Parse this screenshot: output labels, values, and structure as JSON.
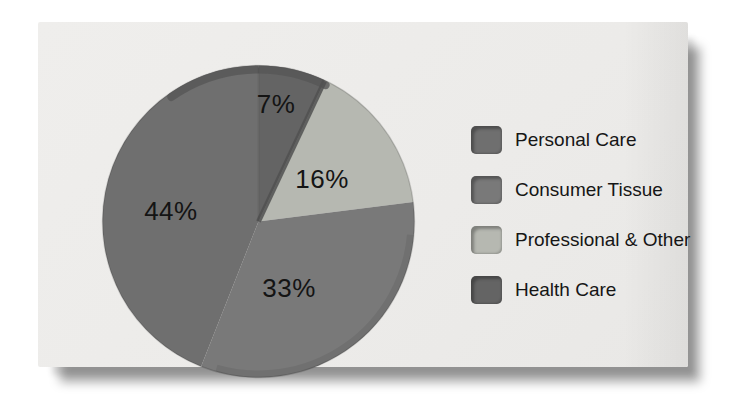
{
  "page": {
    "background": "#ffffff"
  },
  "panel": {
    "background": "#edecea",
    "shadow_color": "rgba(0,0,0,0.35)"
  },
  "chart_data": {
    "type": "pie",
    "title": "",
    "units": "percent",
    "start_angle_deg": 0,
    "direction": "clockwise",
    "legend_position": "right",
    "slices": [
      {
        "label": "Health Care",
        "pct": 7,
        "display": "7%",
        "color": "#646464",
        "label_pos": [
          0.556,
          0.127
        ]
      },
      {
        "label": "Professional & Other",
        "pct": 16,
        "display": "16%",
        "color": "#b6b8b1",
        "label_pos": [
          0.702,
          0.365
        ]
      },
      {
        "label": "Consumer Tissue",
        "pct": 33,
        "display": "33%",
        "color": "#797979",
        "label_pos": [
          0.597,
          0.711
        ]
      },
      {
        "label": "Personal Care",
        "pct": 44,
        "display": "44%",
        "color": "#6f6f6f",
        "label_pos": [
          0.222,
          0.467
        ]
      }
    ],
    "decor": {
      "divider_line": "#4a4a4a",
      "edge_band": "#515151",
      "top_rim": "#565656",
      "outline": "rgba(0,0,0,0.14)",
      "bottom_rim": "rgba(0,0,0,0.07)"
    }
  },
  "legend": {
    "items": [
      {
        "label": "Personal Care",
        "color": "#6f6f6f"
      },
      {
        "label": "Consumer Tissue",
        "color": "#797979"
      },
      {
        "label": "Professional & Other",
        "color": "#b6b8b1"
      },
      {
        "label": "Health Care",
        "color": "#646464"
      }
    ]
  }
}
